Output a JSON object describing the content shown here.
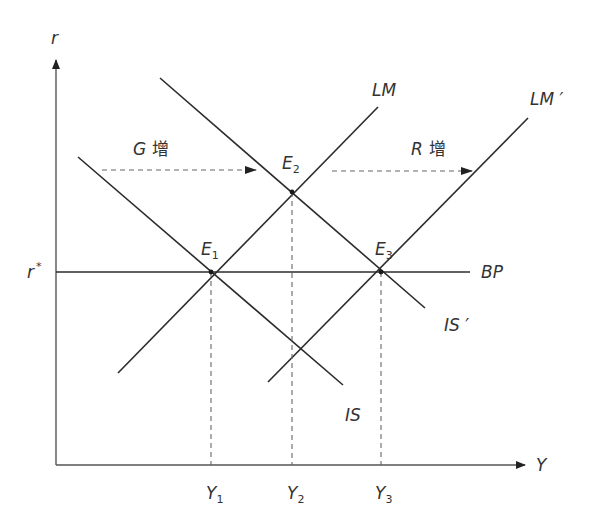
{
  "axes": {
    "y_label": "r",
    "x_label": "Y",
    "r_star_label": "r",
    "r_star_mark": "*"
  },
  "curves": {
    "is": "IS",
    "is_prime": "IS ′",
    "lm": "LM",
    "lm_prime": "LM ′",
    "bp": "BP"
  },
  "equilibria": [
    {
      "letter": "E",
      "sub": "1"
    },
    {
      "letter": "E",
      "sub": "2"
    },
    {
      "letter": "E",
      "sub": "3"
    }
  ],
  "x_ticks": [
    {
      "letter": "Y",
      "sub": "1"
    },
    {
      "letter": "Y",
      "sub": "2"
    },
    {
      "letter": "Y",
      "sub": "3"
    }
  ],
  "shifts": [
    {
      "var": "G",
      "text": "增"
    },
    {
      "var": "R",
      "text": "增"
    }
  ],
  "colors": {
    "line": "#2b2b2b",
    "axis": "#555555",
    "text": "#333333"
  }
}
